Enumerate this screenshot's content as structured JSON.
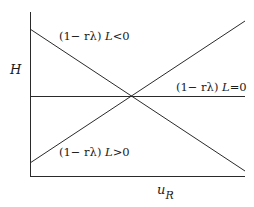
{
  "diagram": {
    "y_axis_label": "H",
    "x_axis_label_base": "u",
    "x_axis_label_sub": "R",
    "lines": [
      {
        "id": "negative",
        "label_prefix": "(1− rλ) ",
        "label_var": "L",
        "label_rel": "<0",
        "slope": "descending"
      },
      {
        "id": "zero",
        "label_prefix": "(1− rλ) ",
        "label_var": "L",
        "label_rel": "=0",
        "slope": "flat"
      },
      {
        "id": "positive",
        "label_prefix": "(1− rλ) ",
        "label_var": "L",
        "label_rel": ">0",
        "slope": "ascending"
      }
    ],
    "colors": {
      "line": "#2a2a2a",
      "background": "#ffffff"
    }
  }
}
